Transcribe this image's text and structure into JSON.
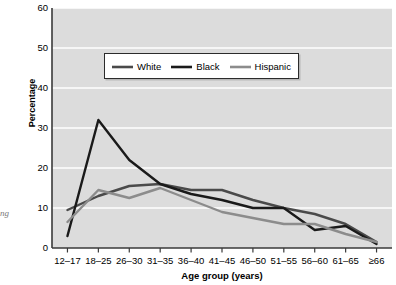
{
  "figure": {
    "bleed_text": "ng",
    "background_color": "#ffffff",
    "plot_background_color": "#dcdcdc",
    "gridline_color": "#ffffff",
    "axis_color": "#3a3a3a"
  },
  "legend": {
    "position": "upper-center",
    "entries": [
      {
        "label": "White",
        "color": "#4a4a4a"
      },
      {
        "label": "Black",
        "color": "#1a1a1a"
      },
      {
        "label": "Hispanic",
        "color": "#8c8c8c"
      }
    ]
  },
  "chart_data": {
    "type": "line",
    "title": "",
    "xlabel": "Age group (years)",
    "ylabel": "Percentage",
    "categories": [
      "12–17",
      "18–25",
      "26–30",
      "31–35",
      "36–40",
      "41–45",
      "46–50",
      "51–55",
      "56–60",
      "61–65",
      "≥66"
    ],
    "ylim": [
      0,
      60
    ],
    "yticks": [
      0,
      10,
      20,
      30,
      40,
      50,
      60
    ],
    "grid": true,
    "series": [
      {
        "name": "White",
        "color": "#4a4a4a",
        "values": [
          9.5,
          13.0,
          15.5,
          16.0,
          14.5,
          14.5,
          12.0,
          10.0,
          8.5,
          6.0,
          1.5
        ]
      },
      {
        "name": "Black",
        "color": "#1a1a1a",
        "values": [
          3.0,
          32.0,
          22.0,
          16.0,
          13.5,
          12.0,
          10.0,
          10.0,
          4.5,
          5.5,
          1.0
        ]
      },
      {
        "name": "Hispanic",
        "color": "#8c8c8c",
        "values": [
          6.5,
          14.5,
          12.5,
          15.0,
          12.0,
          9.0,
          7.5,
          6.0,
          6.0,
          3.5,
          1.5
        ]
      }
    ]
  }
}
